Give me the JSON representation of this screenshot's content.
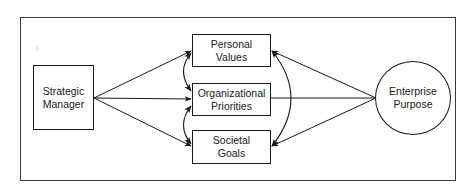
{
  "diagram": {
    "type": "flow",
    "nodes": {
      "strategic_manager": {
        "line1": "Strategic",
        "line2": "Manager",
        "shape": "rectangle"
      },
      "personal_values": {
        "line1": "Personal",
        "line2": "Values",
        "shape": "rectangle"
      },
      "organizational_priorities": {
        "line1": "Organizational",
        "line2": "Priorities",
        "shape": "rectangle"
      },
      "societal_goals": {
        "line1": "Societal",
        "line2": "Goals",
        "shape": "rectangle"
      },
      "enterprise_purpose": {
        "line1": "Enterprise",
        "line2": "Purpose",
        "shape": "circle"
      }
    },
    "edges": [
      {
        "from": "Strategic Manager",
        "to": "Personal Values",
        "arrow": "end"
      },
      {
        "from": "Strategic Manager",
        "to": "Organizational Priorities",
        "arrow": "end"
      },
      {
        "from": "Strategic Manager",
        "to": "Societal Goals",
        "arrow": "end"
      },
      {
        "from": "Personal Values",
        "to": "Organizational Priorities",
        "arrow": "both",
        "style": "curved"
      },
      {
        "from": "Organizational Priorities",
        "to": "Societal Goals",
        "arrow": "both",
        "style": "curved"
      },
      {
        "from": "Personal Values",
        "to": "Societal Goals",
        "arrow": "both",
        "style": "curved"
      },
      {
        "from": "Enterprise Purpose",
        "to": "Personal Values",
        "arrow": "end"
      },
      {
        "from": "Enterprise Purpose",
        "to": "Organizational Priorities",
        "arrow": "none"
      },
      {
        "from": "Enterprise Purpose",
        "to": "Societal Goals",
        "arrow": "end"
      }
    ],
    "colors": {
      "stroke": "#1a1a1a",
      "background": "#ffffff"
    }
  }
}
